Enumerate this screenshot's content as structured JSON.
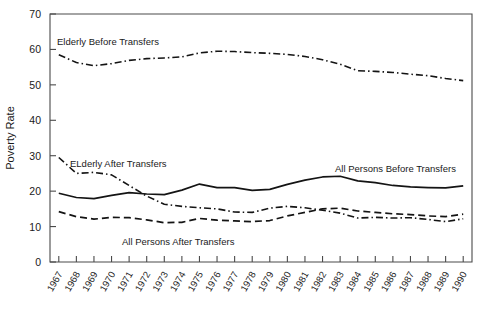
{
  "chart_data": {
    "type": "line",
    "title": "",
    "subtitle": "",
    "xlabel": "",
    "ylabel": "Poverty Rate",
    "ylim": [
      0,
      70
    ],
    "yticks": [
      0,
      10,
      20,
      30,
      40,
      50,
      60,
      70
    ],
    "grid": false,
    "legend_position": "inline-annotations",
    "x": [
      1967,
      1968,
      1969,
      1970,
      1971,
      1972,
      1973,
      1974,
      1975,
      1976,
      1977,
      1978,
      1979,
      1980,
      1981,
      1982,
      1983,
      1984,
      1985,
      1986,
      1987,
      1988,
      1989,
      1990
    ],
    "categories": [
      "1967",
      "1968",
      "1969",
      "1970",
      "1971",
      "1972",
      "1973",
      "1974",
      "1975",
      "1976",
      "1977",
      "1978",
      "1979",
      "1980",
      "1981",
      "1982",
      "1983",
      "1984",
      "1985",
      "1986",
      "1987",
      "1988",
      "1989",
      "1990"
    ],
    "series": [
      {
        "name": "Elderly Before Transfers",
        "style": "dash-dot",
        "color": "#141414",
        "label_text": "Elderly Before Transfers",
        "values": [
          58.5,
          56.3,
          55.4,
          56.0,
          56.9,
          57.4,
          57.6,
          57.9,
          59.0,
          59.5,
          59.4,
          59.1,
          58.9,
          58.6,
          58.0,
          57.1,
          55.8,
          54.0,
          53.8,
          53.5,
          53.0,
          52.6,
          51.8,
          51.2
        ]
      },
      {
        "name": "ELderly After Transfers",
        "style": "dash-dot",
        "color": "#141414",
        "label_text": "ELderly After Transfers",
        "values": [
          29.5,
          25.0,
          25.3,
          24.6,
          21.6,
          18.6,
          16.3,
          15.7,
          15.3,
          15.0,
          14.1,
          14.0,
          15.2,
          15.7,
          15.3,
          14.6,
          13.8,
          12.4,
          12.6,
          12.4,
          12.5,
          12.0,
          11.4,
          12.2
        ]
      },
      {
        "name": "All Persons Before Transfers",
        "style": "solid",
        "color": "#141414",
        "label_text": "All Persons Before Transfers",
        "values": [
          19.4,
          18.2,
          17.9,
          18.8,
          19.6,
          19.2,
          19.0,
          20.3,
          22.0,
          21.0,
          21.0,
          20.2,
          20.5,
          21.9,
          23.1,
          24.0,
          24.2,
          22.9,
          22.4,
          21.6,
          21.2,
          21.0,
          20.9,
          21.5
        ]
      },
      {
        "name": "All Persons After Transfers",
        "style": "dashed",
        "color": "#141414",
        "label_text": "All Persons After Transfers",
        "values": [
          14.2,
          12.8,
          12.1,
          12.6,
          12.5,
          11.9,
          11.1,
          11.2,
          12.3,
          11.8,
          11.6,
          11.4,
          11.7,
          13.0,
          14.0,
          15.0,
          15.2,
          14.4,
          14.0,
          13.6,
          13.4,
          13.0,
          12.8,
          13.5
        ]
      }
    ],
    "annotations": [
      {
        "text": "Elderly Before Transfers",
        "x_px": 57,
        "y_px": 45
      },
      {
        "text": "ELderly After Transfers",
        "x_px": 70,
        "y_px": 167
      },
      {
        "text": "All Persons Before Transfers",
        "x_px": 335,
        "y_px": 172
      },
      {
        "text": "All Persons After Transfers",
        "x_px": 122,
        "y_px": 245
      }
    ]
  }
}
